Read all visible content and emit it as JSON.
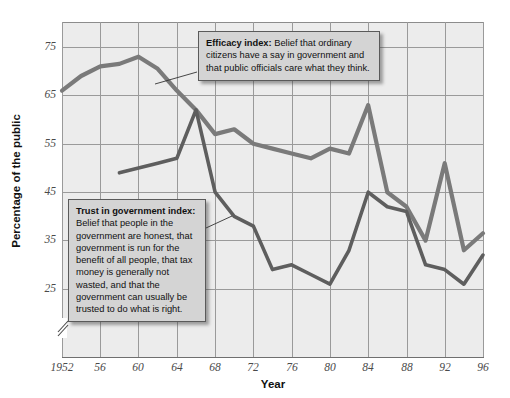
{
  "axes": {
    "ylabel": "Percentage of the public",
    "xlabel": "Year",
    "yticks": [
      "75",
      "65",
      "55",
      "45",
      "35",
      "25"
    ],
    "xticks": [
      "1952",
      "56",
      "60",
      "64",
      "68",
      "72",
      "76",
      "80",
      "84",
      "88",
      "92",
      "96"
    ]
  },
  "callouts": {
    "efficacy": {
      "title": "Efficacy index:",
      "body": "Belief that ordinary citizens have a say in government and that public officials care what they think."
    },
    "trust": {
      "title": "Trust in government index:",
      "body": "Belief that people in the government are honest, that government is run for the benefit of all people, that tax money is generally not wasted, and that the government can usually be trusted to do what is right."
    }
  },
  "colors": {
    "efficacy_line": "#7a7a7a",
    "trust_line": "#5e5e5e",
    "plot_background": "#ececec",
    "gridline": "#9a9a9a",
    "callout_background": "#d4d4d4"
  },
  "chart_data": {
    "type": "line",
    "title": "",
    "xlabel": "Year",
    "ylabel": "Percentage of the public",
    "xlim": [
      1952,
      1996
    ],
    "ylim": [
      20,
      78
    ],
    "ytick_values": [
      25,
      35,
      45,
      55,
      65,
      75
    ],
    "xtick_values": [
      1952,
      1956,
      1960,
      1964,
      1968,
      1972,
      1976,
      1980,
      1984,
      1988,
      1992,
      1996
    ],
    "grid": true,
    "axis_break_below": 25,
    "legend": "none (inline callout labels)",
    "series": [
      {
        "name": "Efficacy index",
        "x": [
          1952,
          1954,
          1956,
          1958,
          1960,
          1962,
          1964,
          1966,
          1968,
          1970,
          1972,
          1974,
          1976,
          1978,
          1980,
          1982,
          1984,
          1986,
          1988,
          1990,
          1992,
          1994,
          1996
        ],
        "values": [
          66,
          69,
          71,
          71.5,
          73,
          70.5,
          66,
          62,
          57,
          58,
          55,
          54,
          53,
          52,
          54,
          53,
          63,
          45,
          42,
          35,
          51,
          33,
          36.5
        ]
      },
      {
        "name": "Trust in government index",
        "x": [
          1958,
          1960,
          1962,
          1964,
          1966,
          1968,
          1970,
          1972,
          1974,
          1976,
          1978,
          1980,
          1982,
          1984,
          1986,
          1988,
          1990,
          1992,
          1994,
          1996
        ],
        "values": [
          49,
          50,
          51,
          52,
          62,
          45,
          40,
          38,
          29,
          30,
          28,
          26,
          33,
          45,
          42,
          41,
          30,
          29,
          26,
          32
        ]
      }
    ]
  }
}
